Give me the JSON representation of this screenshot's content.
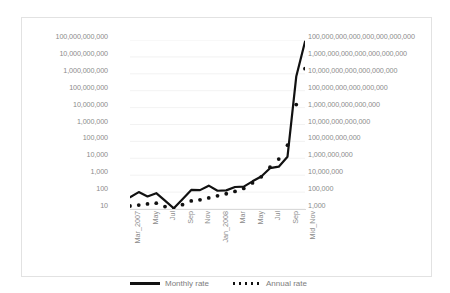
{
  "chart_data": {
    "type": "line",
    "title": "",
    "subtitle": "",
    "xlabel": "",
    "ylabel": "",
    "grid": true,
    "legend_position": "bottom",
    "categories": [
      "Mar_2007",
      "May",
      "Jul",
      "Sep",
      "Nov",
      "Jan_2008",
      "Mar",
      "May",
      "Jul",
      "Sep",
      "Mid_Nov"
    ],
    "x_tick_labels": [
      "Mar_2007",
      "May",
      "Jul",
      "Sep",
      "Nov",
      "Jan_2008",
      "Mar",
      "May",
      "Jul",
      "Sep",
      "Mid_Nov"
    ],
    "left_axis": {
      "name": "Monthly rate",
      "scale": "log",
      "ylim": [
        10,
        100000000000
      ],
      "tick_labels": [
        "100,000,000,000",
        "10,000,000,000",
        "1,000,000,000",
        "100,000,000",
        "10,000,000",
        "1,000,000",
        "100,000",
        "10,000",
        "1,000",
        "100",
        "10"
      ],
      "tick_values": [
        100000000000,
        10000000000,
        1000000000,
        100000000,
        10000000,
        1000000,
        100000,
        10000,
        1000,
        100,
        10
      ]
    },
    "right_axis": {
      "name": "Annual rate",
      "scale": "log",
      "ylim": [
        1000,
        100000000000000000000000
      ],
      "tick_labels": [
        "100,000,000,000,000,000,000,000",
        "1,000,000,000,000,000,000,000",
        "10,000,000,000,000,000,000",
        "100,000,000,000,000,000",
        "1,000,000,000,000,000",
        "10,000,000,000,000",
        "100,000,000,000",
        "1,000,000,000",
        "10,000,000",
        "100,000",
        "1,000"
      ],
      "tick_values": [
        1e+23,
        1e+21,
        1e+19,
        1e+17,
        1000000000000000.0,
        10000000000000.0,
        100000000000.0,
        1000000000.0,
        10000000.0,
        100000.0,
        1000.0
      ]
    },
    "series": [
      {
        "name": "Monthly rate",
        "style": "solid",
        "color": "#111111",
        "axis": "left",
        "x": [
          "Mar_2007",
          "Apr",
          "May",
          "Jun",
          "Jul",
          "Aug",
          "Sep",
          "Oct",
          "Nov",
          "Dec",
          "Jan_2008",
          "Feb",
          "Mar",
          "Apr",
          "May",
          "Jun",
          "Jul",
          "Aug",
          "Sep",
          "Oct",
          "Mid_Nov"
        ],
        "values": [
          50,
          100,
          55,
          86,
          31,
          11,
          38,
          135,
          131,
          240,
          120,
          126,
          200,
          212,
          434,
          839,
          2600,
          3190,
          12400,
          690000000,
          79600000000
        ]
      },
      {
        "name": "Annual rate",
        "style": "dotted",
        "color": "#111111",
        "axis": "left",
        "x": [
          "Mar_2007",
          "Apr",
          "May",
          "Jun",
          "Jul",
          "Aug",
          "Sep",
          "Oct",
          "Nov",
          "Dec",
          "Jan_2008",
          "Feb",
          "Mar",
          "Apr",
          "May",
          "Jun",
          "Jul",
          "Aug",
          "Sep",
          "Oct",
          "Mid_Nov"
        ],
        "values": [
          15,
          17,
          20,
          22,
          14,
          9,
          18,
          30,
          35,
          45,
          60,
          80,
          110,
          165,
          350,
          800,
          3000,
          9000,
          60000,
          15000000,
          2000000000
        ]
      }
    ],
    "annotations": []
  },
  "legend": {
    "items": [
      {
        "label": "Monthly rate",
        "marker": "solid-line"
      },
      {
        "label": "Annual rate",
        "marker": "dotted-line"
      }
    ]
  }
}
